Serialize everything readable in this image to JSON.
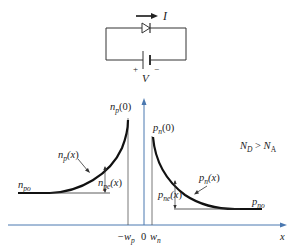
{
  "circuit": {
    "current_label": "I",
    "voltage_label": "V",
    "plus_label": "+",
    "minus_label": "−"
  },
  "graph": {
    "condition": "N_D > N_A",
    "condition_parts": {
      "nd": "N",
      "nd_sub": "D",
      "op": " > ",
      "na": "N",
      "na_sub": "A"
    },
    "left_curve": {
      "peak_label": "n_p(0)",
      "func_label": "n_p(x)",
      "excess_label": "n_pe(x)",
      "equilibrium_label": "n_po"
    },
    "right_curve": {
      "peak_label": "p_n(0)",
      "func_label": "p_n(x)",
      "excess_label": "p_ne(x)",
      "equilibrium_label": "p_no"
    },
    "x_axis": {
      "label": "x",
      "ticks": [
        "−w_p",
        "0",
        "w_n"
      ]
    }
  },
  "colors": {
    "axis": "#4a78b0",
    "curve": "#111111",
    "line": "#333333"
  }
}
